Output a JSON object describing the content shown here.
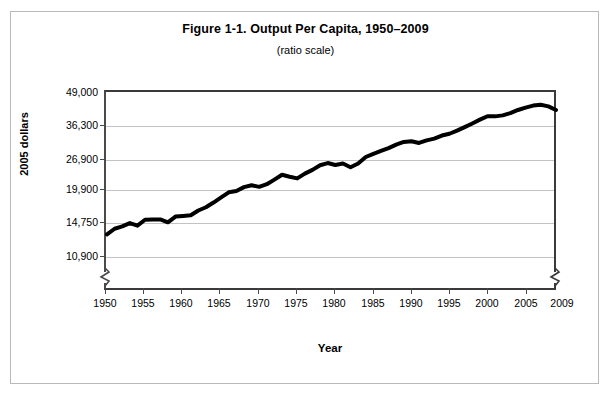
{
  "figure": {
    "title": "Figure 1-1. Output Per Capita, 1950–2009",
    "subtitle": "(ratio scale)"
  },
  "axes": {
    "y_title": "2005 dollars",
    "x_title": "Year",
    "y_ticks": [
      "49,000",
      "36,300",
      "26,900",
      "19,900",
      "14,750",
      "10,900"
    ],
    "x_ticks": [
      "1950",
      "1955",
      "1960",
      "1965",
      "1970",
      "1975",
      "1980",
      "1985",
      "1990",
      "1995",
      "2000",
      "2005",
      "2009"
    ]
  },
  "chart_data": {
    "type": "line",
    "title": "Figure 1-1. Output Per Capita, 1950–2009",
    "subtitle": "(ratio scale)",
    "xlabel": "Year",
    "ylabel": "2005 dollars",
    "yscale": "log",
    "grid": true,
    "legend": null,
    "axis_break": {
      "left": true,
      "right": true,
      "note": "zigzag break below lowest gridline on both vertical axes"
    },
    "ylim": [
      10900,
      49000
    ],
    "xlim": [
      1950,
      2009
    ],
    "ytick_values": [
      49000,
      36300,
      26900,
      19900,
      14750,
      10900
    ],
    "ytick_labels": [
      "49,000",
      "36,300",
      "26,900",
      "19,900",
      "14,750",
      "10,900"
    ],
    "xtick_values": [
      1950,
      1955,
      1960,
      1965,
      1970,
      1975,
      1980,
      1985,
      1990,
      1995,
      2000,
      2005,
      2009
    ],
    "series": [
      {
        "name": "Output per capita",
        "color": "#000000",
        "linewidth": 4,
        "x": [
          1950,
          1951,
          1952,
          1953,
          1954,
          1955,
          1956,
          1957,
          1958,
          1959,
          1960,
          1961,
          1962,
          1963,
          1964,
          1965,
          1966,
          1967,
          1968,
          1969,
          1970,
          1971,
          1972,
          1973,
          1974,
          1975,
          1976,
          1977,
          1978,
          1979,
          1980,
          1981,
          1982,
          1983,
          1984,
          1985,
          1986,
          1987,
          1988,
          1989,
          1990,
          1991,
          1992,
          1993,
          1994,
          1995,
          1996,
          1997,
          1998,
          1999,
          2000,
          2001,
          2002,
          2003,
          2004,
          2005,
          2006,
          2007,
          2008,
          2009
        ],
        "y": [
          13400,
          14100,
          14400,
          14850,
          14500,
          15300,
          15350,
          15350,
          14950,
          15750,
          15850,
          15950,
          16650,
          17150,
          17900,
          18750,
          19650,
          19900,
          20600,
          20950,
          20650,
          21150,
          22050,
          23050,
          22650,
          22300,
          23300,
          24100,
          25150,
          25650,
          25200,
          25550,
          24700,
          25550,
          27100,
          27900,
          28650,
          29400,
          30350,
          31100,
          31300,
          30800,
          31550,
          32050,
          32950,
          33500,
          34450,
          35600,
          36800,
          38100,
          39300,
          39250,
          39600,
          40450,
          41600,
          42500,
          43300,
          43600,
          43000,
          41600
        ]
      }
    ]
  }
}
